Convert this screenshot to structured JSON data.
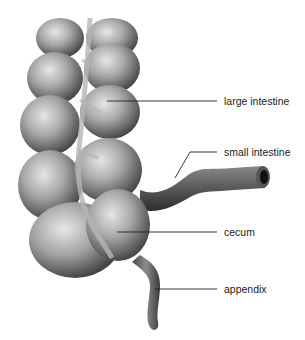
{
  "diagram": {
    "labels": [
      {
        "id": "large-intestine",
        "text": "large intestine",
        "x": 224,
        "y": 95,
        "line": [
          [
            107,
            101
          ],
          [
            217,
            101
          ]
        ]
      },
      {
        "id": "small-intestine",
        "text": "small intestine",
        "x": 224,
        "y": 146,
        "line": [
          [
            175,
            178
          ],
          [
            190,
            152
          ],
          [
            217,
            152
          ]
        ]
      },
      {
        "id": "cecum",
        "text": "cecum",
        "x": 224,
        "y": 226,
        "line": [
          [
            117,
            232
          ],
          [
            217,
            232
          ]
        ]
      },
      {
        "id": "appendix",
        "text": "appendix",
        "x": 224,
        "y": 283,
        "line": [
          [
            155,
            289
          ],
          [
            217,
            289
          ]
        ]
      }
    ],
    "colors": {
      "tissue_light": "#d8d8d8",
      "tissue_mid": "#9a9a9a",
      "tissue_dark": "#3a3a3a",
      "line": "#222222",
      "background": "#ffffff"
    }
  }
}
